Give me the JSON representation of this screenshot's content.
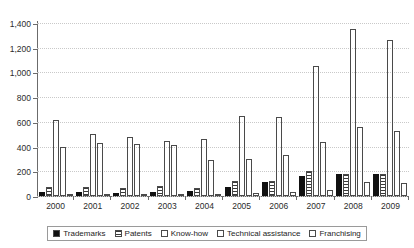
{
  "chart_data": {
    "type": "bar",
    "title": "",
    "subtitle": "",
    "xlabel": "",
    "ylabel": "",
    "ylim": [
      0,
      1400
    ],
    "yticks": [
      0,
      200,
      400,
      600,
      800,
      1000,
      1200,
      1400
    ],
    "ytick_labels": [
      "0",
      "200",
      "400",
      "600",
      "800",
      "1,000",
      "1,200",
      "1,400"
    ],
    "grid": true,
    "legend_position": "bottom",
    "categories": [
      "2000",
      "2001",
      "2002",
      "2003",
      "2004",
      "2005",
      "2006",
      "2007",
      "2008",
      "2009"
    ],
    "series": [
      {
        "name": "Trademarks",
        "pattern": "solid-black",
        "color": "#111111",
        "values": [
          30,
          30,
          22,
          30,
          38,
          70,
          110,
          165,
          175,
          180
        ]
      },
      {
        "name": "Patents",
        "pattern": "horizontal-stripes",
        "color": "#3a3a3a",
        "values": [
          72,
          75,
          62,
          80,
          68,
          125,
          120,
          200,
          180,
          180
        ]
      },
      {
        "name": "Know-how",
        "pattern": "dotted-crosshatch",
        "color": "#8d8d8d",
        "values": [
          615,
          505,
          480,
          448,
          465,
          645,
          640,
          1050,
          1355,
          1265
        ]
      },
      {
        "name": "Technical assistance",
        "pattern": "solid-gray",
        "color": "#6e6e6e",
        "values": [
          400,
          425,
          418,
          410,
          290,
          300,
          330,
          435,
          555,
          530
        ]
      },
      {
        "name": "Franchising",
        "pattern": "empty-white",
        "color": "#ffffff",
        "values": [
          12,
          15,
          12,
          12,
          14,
          25,
          30,
          45,
          110,
          105
        ]
      }
    ]
  }
}
